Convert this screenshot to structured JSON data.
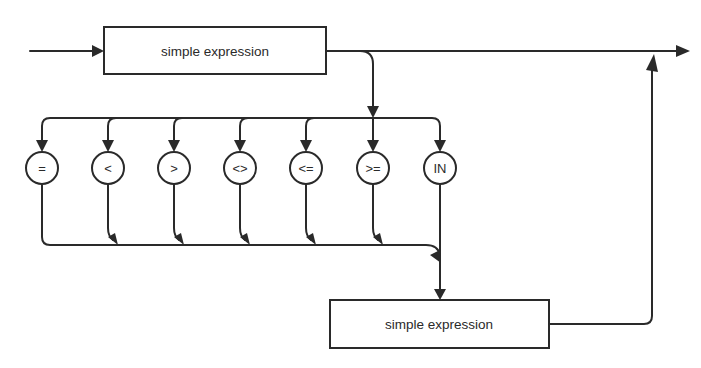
{
  "diagram": {
    "type": "syntax-diagram",
    "colors": {
      "stroke": "#2a2a2a",
      "background": "#ffffff"
    },
    "top_box": {
      "label": "simple expression"
    },
    "bottom_box": {
      "label": "simple expression"
    },
    "operators": [
      {
        "label": "="
      },
      {
        "label": "<"
      },
      {
        "label": ">"
      },
      {
        "label": "<>"
      },
      {
        "label": "<="
      },
      {
        "label": ">="
      },
      {
        "label": "IN"
      }
    ]
  }
}
